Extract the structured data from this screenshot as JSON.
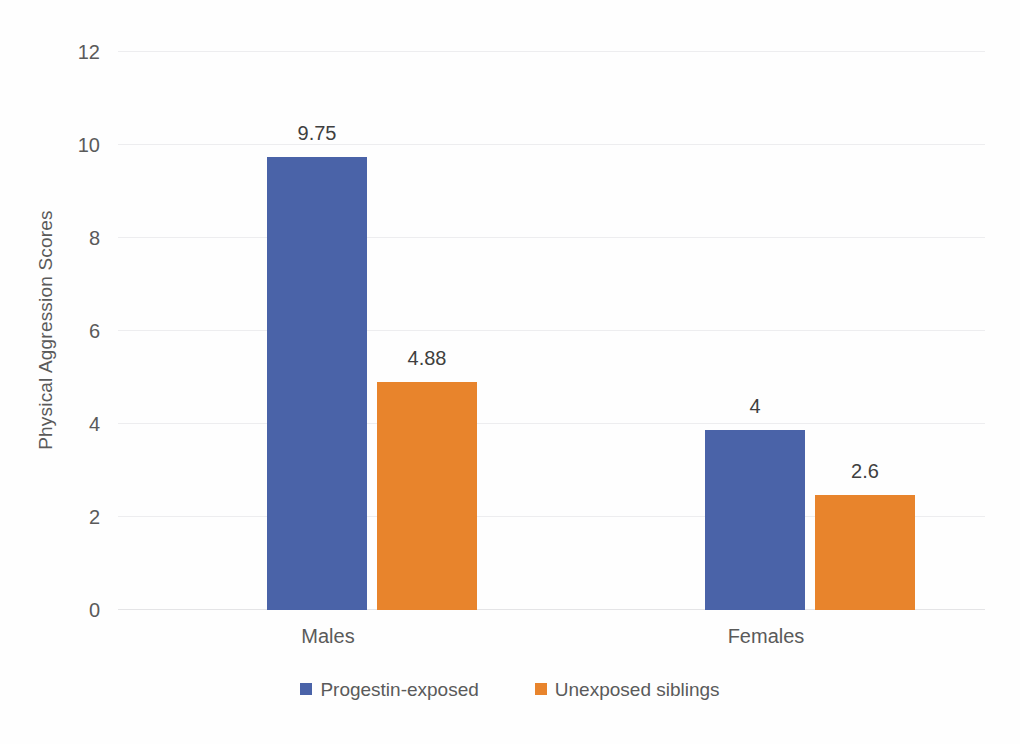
{
  "chart_data": {
    "type": "bar",
    "title": "",
    "subtitle": "",
    "xlabel": "",
    "ylabel": "Physical Aggression Scores",
    "categories": [
      "Males",
      "Females"
    ],
    "series": [
      {
        "name": "Progestin-exposed",
        "color": "#4a63a8",
        "values": [
          9.75,
          4
        ],
        "value_labels": [
          "9.75",
          "4"
        ],
        "plotted_values": [
          9.75,
          3.87
        ]
      },
      {
        "name": "Unexposed siblings",
        "color": "#e8842c",
        "values": [
          4.88,
          2.6
        ],
        "value_labels": [
          "4.88",
          "2.6"
        ],
        "plotted_values": [
          4.9,
          2.48
        ]
      }
    ],
    "ylim": [
      0,
      12
    ],
    "y_ticks": [
      0,
      2,
      4,
      6,
      8,
      10,
      12
    ],
    "y_tick_labels": [
      "0",
      "2",
      "4",
      "6",
      "8",
      "10",
      "12"
    ],
    "grid": true,
    "grid_axis": "y",
    "legend_position": "bottom",
    "background_color": "#fefefe",
    "gridline_color": "#ededef",
    "text_color": "#5a5a5a",
    "data_label_color": "#3f3f3f"
  },
  "legend": {
    "items": [
      {
        "label": "Progestin-exposed",
        "color": "#4a63a8",
        "swatch_icon": "square-swatch-icon"
      },
      {
        "label": "Unexposed siblings",
        "color": "#e8842c",
        "swatch_icon": "square-swatch-icon"
      }
    ]
  }
}
